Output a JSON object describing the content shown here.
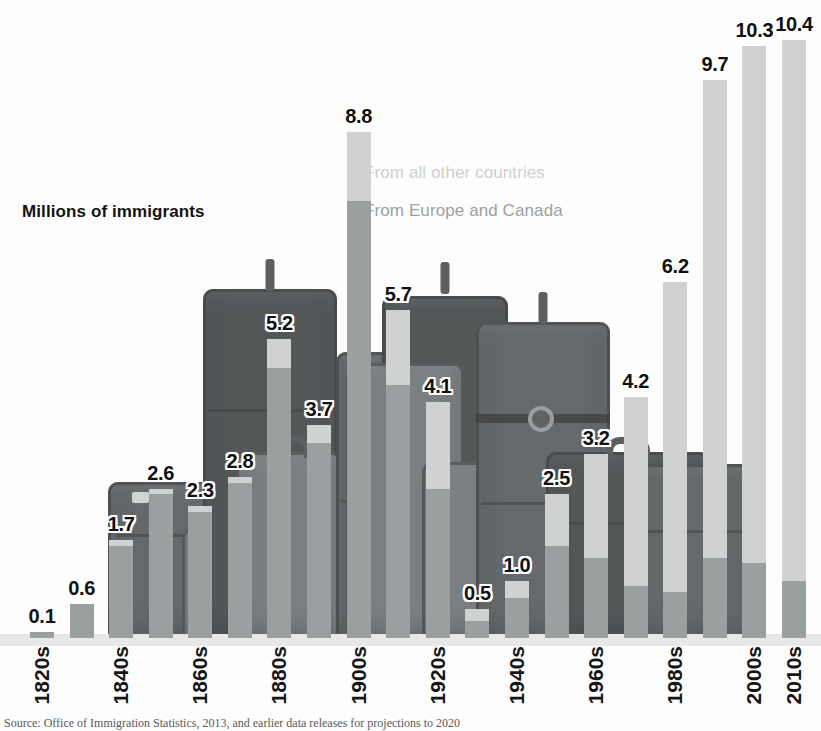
{
  "chart_data": {
    "type": "bar",
    "stacked": true,
    "title": "Millions of immigrants",
    "xlabel": "",
    "ylabel": "Millions of immigrants",
    "ylim": [
      0,
      10.4
    ],
    "grid": false,
    "legend_position": "inside-upper-center",
    "categories": [
      "1820s",
      "1830s",
      "1840s",
      "1850s",
      "1860s",
      "1870s",
      "1880s",
      "1890s",
      "1900s",
      "1910s",
      "1920s",
      "1930s",
      "1940s",
      "1950s",
      "1960s",
      "1970s",
      "1980s",
      "1990s",
      "2000s",
      "2010s"
    ],
    "tick_labels": [
      "1820s",
      "",
      "1840s",
      "",
      "1860s",
      "",
      "1880s",
      "",
      "1900s",
      "",
      "1920s",
      "",
      "1940s",
      "",
      "1960s",
      "",
      "1980s",
      "",
      "2000s",
      "2010s"
    ],
    "data_labels": [
      "0.1",
      "0.6",
      "1.7",
      "2.6",
      "2.3",
      "2.8",
      "5.2",
      "3.7",
      "8.8",
      "5.7",
      "4.1",
      "0.5",
      "1.0",
      "2.5",
      "3.2",
      "4.2",
      "6.2",
      "9.7",
      "10.3",
      "10.4"
    ],
    "totals": [
      0.1,
      0.6,
      1.7,
      2.6,
      2.3,
      2.8,
      5.2,
      3.7,
      8.8,
      5.7,
      4.1,
      0.5,
      1.0,
      2.5,
      3.2,
      4.2,
      6.2,
      9.7,
      10.3,
      10.4
    ],
    "series": [
      {
        "name": "From Europe and Canada",
        "color": "#9aa0a0",
        "values": [
          0.1,
          0.6,
          1.6,
          2.5,
          2.2,
          2.7,
          4.7,
          3.4,
          7.6,
          4.4,
          2.6,
          0.3,
          0.7,
          1.6,
          1.4,
          0.9,
          0.8,
          1.4,
          1.3,
          1.0
        ]
      },
      {
        "name": "From all other countries",
        "color": "#cfd2d1",
        "values": [
          0.0,
          0.0,
          0.1,
          0.1,
          0.1,
          0.1,
          0.5,
          0.3,
          1.2,
          1.3,
          1.5,
          0.2,
          0.3,
          0.9,
          1.8,
          3.3,
          5.4,
          8.3,
          9.0,
          9.4
        ]
      }
    ],
    "colors": {
      "other_countries": "#cfd2d1",
      "europe_canada": "#9aa0a0",
      "label_text": "#141414",
      "background": "#fdfdfd"
    }
  },
  "legend": {
    "other_countries": "From all other countries",
    "europe_canada": "From Europe and Canada"
  },
  "source": {
    "note": "Source: Office of Immigration Statistics, 2013, and earlier data releases for projections to 2020"
  }
}
